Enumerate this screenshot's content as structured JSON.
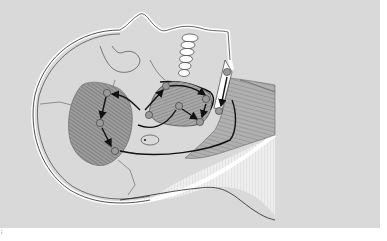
{
  "figure": {
    "colors": {
      "panel": "#d9d9d9",
      "outline": "#111111",
      "muscle": "#8a8a8a",
      "muscle_light": "#b5b5b5",
      "skin_outline": "#ffffff",
      "teeth": "#ffffff",
      "marker": "#9a9a9a"
    },
    "corner_mark": "ⁱ",
    "markers": [
      {
        "id": "m1",
        "x": 107,
        "y": 93,
        "label": ""
      },
      {
        "id": "m2",
        "x": 100,
        "y": 123,
        "label": ""
      },
      {
        "id": "m3",
        "x": 115,
        "y": 151,
        "label": ""
      },
      {
        "id": "m4",
        "x": 166,
        "y": 86,
        "label": ""
      },
      {
        "id": "m5",
        "x": 149,
        "y": 115,
        "label": ""
      },
      {
        "id": "m6",
        "x": 179,
        "y": 106,
        "label": ""
      },
      {
        "id": "m7",
        "x": 206,
        "y": 99,
        "label": ""
      },
      {
        "id": "m8",
        "x": 200,
        "y": 122,
        "label": ""
      },
      {
        "id": "m9",
        "x": 227,
        "y": 72,
        "label": ""
      },
      {
        "id": "m10",
        "x": 219,
        "y": 111,
        "label": ""
      }
    ]
  }
}
